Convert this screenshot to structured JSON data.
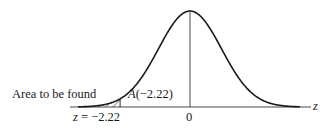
{
  "figure": {
    "type": "standard-normal-curve",
    "labels": {
      "area_label": "Area to be found",
      "area_function": "A(−2.22)",
      "area_function_letter": "A",
      "area_function_arg": "(−2.22)",
      "z_value_label": "z = −2.22",
      "z_var": "z",
      "z_eq": " = −2.22",
      "origin_label": "0",
      "axis_label": "z"
    },
    "z_cut": -2.22,
    "shaded_region": "left tail, z < -2.22",
    "colors": {
      "line": "#1a1a1a",
      "background": "#ffffff"
    }
  }
}
